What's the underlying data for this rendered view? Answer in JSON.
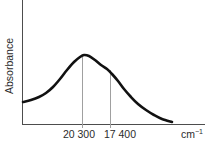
{
  "figure": {
    "background_color": "#ffffff",
    "curve_color": "#111111",
    "axis_color": "#4d4d4d",
    "gridline_color": "#a0a0a0",
    "text_color": "#2b2b2b",
    "ylabel": "Absorbance",
    "xunit_base": "cm",
    "xunit_exponent": "−1",
    "caption_cut": ""
  },
  "chart_data": {
    "type": "line",
    "title": "",
    "xlabel": "cm−1",
    "ylabel": "Absorbance",
    "grid": false,
    "legend": null,
    "x_tick_labels": [
      "20 300",
      "17 400"
    ],
    "x_tick_values": [
      20300,
      17400
    ],
    "annotations": [
      {
        "label": "20 300",
        "type": "vertical-gridline",
        "x": 20300,
        "note": "at absorption maximum"
      },
      {
        "label": "17 400",
        "type": "vertical-gridline",
        "x": 17400,
        "note": "at shoulder on low-energy side"
      }
    ],
    "axis_direction": "wavenumber decreasing to the right",
    "series": [
      {
        "name": "Absorbance spectrum",
        "points_px": [
          [
            23,
            102
          ],
          [
            31,
            100
          ],
          [
            39,
            97
          ],
          [
            46,
            93
          ],
          [
            53,
            87
          ],
          [
            60,
            79
          ],
          [
            67,
            70
          ],
          [
            74,
            62
          ],
          [
            80,
            57
          ],
          [
            84,
            55
          ],
          [
            89,
            56
          ],
          [
            95,
            60
          ],
          [
            101,
            65
          ],
          [
            107,
            69
          ],
          [
            112,
            74
          ],
          [
            118,
            81
          ],
          [
            124,
            89
          ],
          [
            131,
            97
          ],
          [
            138,
            104
          ],
          [
            146,
            110
          ],
          [
            154,
            115
          ],
          [
            162,
            119
          ],
          [
            172,
            122
          ]
        ],
        "peak_px": [
          84,
          55
        ],
        "shoulder_px": [
          110,
          71
        ]
      }
    ]
  },
  "geometry": {
    "y_axis_x": 22,
    "x_axis_y": 124,
    "x_axis_end": 205,
    "gridline_1_x": 82,
    "gridline_2_x": 110,
    "gridline_top_1_y": 57,
    "gridline_top_2_y": 70,
    "tick_bottom_y": 128
  },
  "labels": {
    "tick_1": "20 300",
    "tick_1_x": 79,
    "tick_2": "17 400",
    "tick_2_x": 120,
    "tick_text_y": 138,
    "unit_x": 181,
    "unit_y": 138,
    "ylabel_x": 13,
    "ylabel_y": 66
  }
}
